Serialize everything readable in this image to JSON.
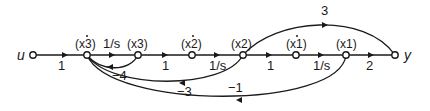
{
  "diagram": {
    "type": "signal-flow-graph",
    "input_label": "u",
    "output_label": "y",
    "nodes": [
      {
        "id": "u",
        "label": "u",
        "x": 33
      },
      {
        "id": "x3dot",
        "label": "(x3)",
        "dot": true,
        "x": 87
      },
      {
        "id": "x3",
        "label": "(x3)",
        "dot": false,
        "x": 138
      },
      {
        "id": "x2dot",
        "label": "(x2)",
        "dot": true,
        "x": 192
      },
      {
        "id": "x2",
        "label": "(x2)",
        "dot": false,
        "x": 243
      },
      {
        "id": "x1dot",
        "label": "(x1)",
        "dot": true,
        "x": 296
      },
      {
        "id": "x1",
        "label": "(x1)",
        "dot": false,
        "x": 346
      },
      {
        "id": "y",
        "label": "y",
        "x": 395
      }
    ],
    "forward_gains": {
      "u_to_x3dot": "1",
      "x3dot_to_x3": "1/s",
      "x3_to_x2dot": "1",
      "x2dot_to_x2": "1/s",
      "x2_to_x1dot": "1",
      "x1dot_to_x1": "1/s",
      "x1_to_y": "2"
    },
    "feedforward": {
      "x2_to_y": "3"
    },
    "feedback_gains": {
      "x3_to_x3dot": "−4",
      "x2_to_x3dot": "−3",
      "x1_to_x3dot": "−1"
    }
  }
}
